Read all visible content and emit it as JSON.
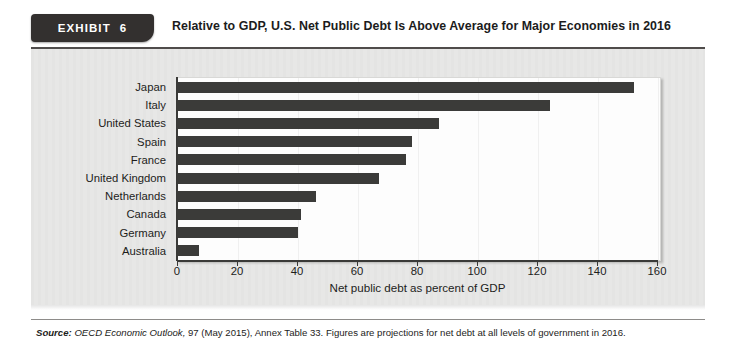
{
  "exhibit": {
    "word": "EXHIBIT",
    "number": "6",
    "title": "Relative to GDP, U.S. Net Public Debt Is Above Average for Major Economies in 2016"
  },
  "source": {
    "label": "Source:",
    "italic_part": "OECD Economic Outlook,",
    "rest": " 97 (May 2015), Annex Table 33. Figures are projections for net debt at all levels of government in 2016."
  },
  "chart_data": {
    "type": "bar",
    "orientation": "horizontal",
    "title": "Relative to GDP, U.S. Net Public Debt Is Above Average for Major Economies in 2016",
    "xlabel": "Net public debt as percent of GDP",
    "ylabel": "",
    "categories": [
      "Japan",
      "Italy",
      "United States",
      "Spain",
      "France",
      "United Kingdom",
      "Netherlands",
      "Canada",
      "Germany",
      "Australia"
    ],
    "values": [
      152,
      124,
      87,
      78,
      76,
      67,
      46,
      41,
      40,
      7
    ],
    "xlim": [
      0,
      160
    ],
    "xticks": [
      0,
      20,
      40,
      60,
      80,
      100,
      120,
      140,
      160
    ],
    "xtick_labels": [
      "0",
      "20",
      "40",
      "60",
      "80",
      "100",
      "120",
      "140",
      "160"
    ],
    "grid": false,
    "legend": null,
    "bar_color": "#3b3b39",
    "plot_background": "#fdfdfd",
    "panel_background": "#e7e7e6"
  }
}
